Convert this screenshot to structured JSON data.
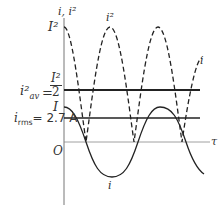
{
  "diagram": {
    "axis_labels": {
      "y_axis": "i, i²",
      "x_axis": "τ",
      "origin": "O"
    },
    "level_labels": {
      "peak_squared": "I²",
      "average_lhs": "i²",
      "average_lhs_sub": "av",
      "average_eq": "=",
      "average_num": "I²",
      "average_den": "2",
      "peak": "I",
      "rms_lhs": "i",
      "rms_sub": "rms",
      "rms_value": "= 2.7 A"
    },
    "curve_labels": {
      "squared_curve": "i²",
      "squared_curve_right": "i",
      "current_curve": "i"
    },
    "colors": {
      "ink": "#333333",
      "axis": "#666666",
      "background": "#ffffff"
    }
  }
}
